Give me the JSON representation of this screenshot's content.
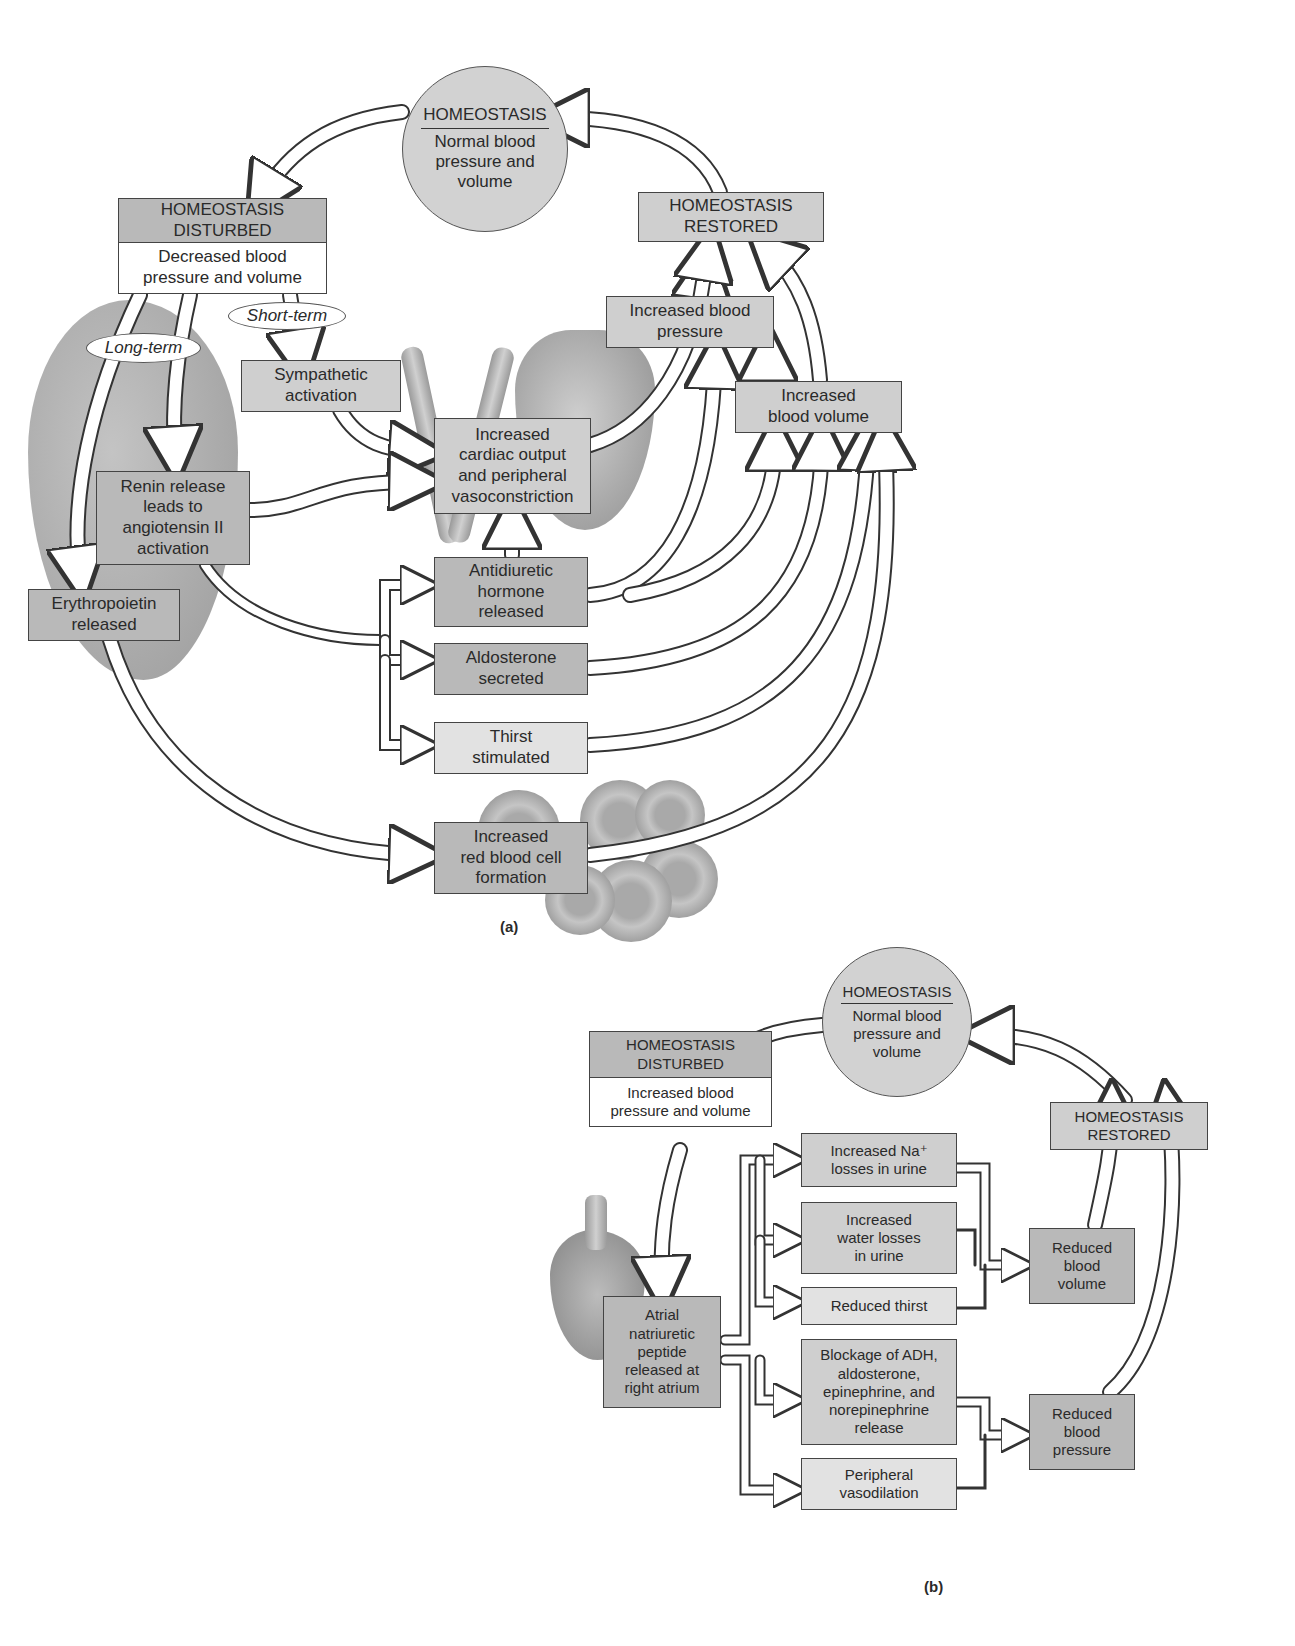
{
  "figure": {
    "panel_a": {
      "label": "(a)",
      "homeostasis_circle": {
        "title": "HOMEOSTASIS",
        "lines": [
          "Normal blood",
          "pressure and",
          "volume"
        ]
      },
      "disturbed": {
        "title_lines": [
          "HOMEOSTASIS",
          "DISTURBED"
        ],
        "body_lines": [
          "Decreased blood",
          "pressure and volume"
        ]
      },
      "restored": {
        "lines": [
          "HOMEOSTASIS",
          "RESTORED"
        ]
      },
      "short_term_label": "Short-term",
      "long_term_label": "Long-term",
      "boxes": {
        "sympathetic": [
          "Sympathetic",
          "activation"
        ],
        "cardiac": [
          "Increased",
          "cardiac output",
          "and peripheral",
          "vasoconstriction"
        ],
        "renin": [
          "Renin release",
          "leads to",
          "angiotensin II",
          "activation"
        ],
        "erythropoietin": [
          "Erythropoietin",
          "released"
        ],
        "adh": [
          "Antidiuretic",
          "hormone",
          "released"
        ],
        "aldosterone": [
          "Aldosterone",
          "secreted"
        ],
        "thirst": [
          "Thirst",
          "stimulated"
        ],
        "rbc": [
          "Increased",
          "red blood cell",
          "formation"
        ],
        "inc_bp": [
          "Increased blood",
          "pressure"
        ],
        "inc_bv": [
          "Increased",
          "blood volume"
        ]
      }
    },
    "panel_b": {
      "label": "(b)",
      "homeostasis_circle": {
        "title": "HOMEOSTASIS",
        "lines": [
          "Normal blood",
          "pressure and",
          "volume"
        ]
      },
      "disturbed": {
        "title_lines": [
          "HOMEOSTASIS",
          "DISTURBED"
        ],
        "body_lines": [
          "Increased blood",
          "pressure and volume"
        ]
      },
      "restored": {
        "lines": [
          "HOMEOSTASIS",
          "RESTORED"
        ]
      },
      "boxes": {
        "anp": [
          "Atrial",
          "natriuretic",
          "peptide",
          "released at",
          "right atrium"
        ],
        "na_loss": [
          "Increased Na⁺",
          "losses in urine"
        ],
        "water_loss": [
          "Increased",
          "water losses",
          "in urine"
        ],
        "reduced_thirst": [
          "Reduced thirst"
        ],
        "blockage": [
          "Blockage of ADH,",
          "aldosterone,",
          "epinephrine, and",
          "norepinephrine",
          "release"
        ],
        "vasodilation": [
          "Peripheral",
          "vasodilation"
        ],
        "reduced_bv": [
          "Reduced",
          "blood",
          "volume"
        ],
        "reduced_bp": [
          "Reduced",
          "blood",
          "pressure"
        ]
      }
    }
  },
  "colors": {
    "dark_box": "#b9b9b9",
    "mid_box": "#cfcfcf",
    "light_box": "#e2e2e2",
    "circle": "#d2d2d2",
    "outline": "#444444"
  }
}
